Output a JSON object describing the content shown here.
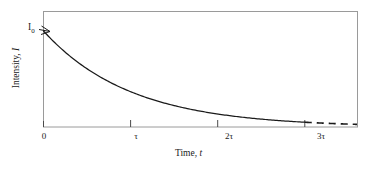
{
  "chart_data": {
    "type": "line",
    "title": "",
    "subtitle": "",
    "xlabel": "Time, t",
    "xlabel_text": "Time,",
    "xlabel_symbol": "t",
    "ylabel": "Intensity, I",
    "ylabel_text": "Intensity,",
    "ylabel_symbol": "I",
    "x_tick_labels": [
      "0",
      "τ",
      "2τ",
      "3τ"
    ],
    "x_tick_values": [
      0,
      1,
      2,
      3
    ],
    "y_tick_labels": [
      "I₀"
    ],
    "y_annotation": "I₀",
    "y_annotation_base": "I",
    "y_annotation_sub": "0",
    "xlim": [
      0,
      3.6
    ],
    "ylim": [
      0,
      1.05
    ],
    "grid": false,
    "legend": null,
    "curve_equation": "I = I0 * exp(-t/tau)",
    "series": [
      {
        "name": "Intensity decay",
        "style": "solid",
        "x": [
          0.0,
          0.15,
          0.3,
          0.45,
          0.6,
          0.75,
          0.9,
          1.0,
          1.2,
          1.4,
          1.6,
          1.8,
          2.0,
          2.2,
          2.4,
          2.6,
          2.8,
          3.0
        ],
        "values": [
          1.0,
          0.861,
          0.741,
          0.638,
          0.549,
          0.472,
          0.407,
          0.368,
          0.301,
          0.247,
          0.202,
          0.165,
          0.135,
          0.111,
          0.091,
          0.074,
          0.061,
          0.05
        ]
      },
      {
        "name": "Intensity decay extrapolation",
        "style": "dashed",
        "x": [
          3.0,
          3.2,
          3.4,
          3.6
        ],
        "values": [
          0.05,
          0.041,
          0.033,
          0.027
        ]
      }
    ],
    "annotations": [
      {
        "name": "initial-intensity-pointer",
        "label": "I₀",
        "x": 0,
        "y": 1.0,
        "arrow": true
      }
    ],
    "colors": {
      "curve": "#1a1a1a",
      "frame": "#9a9a9a",
      "tick": "#4a4a4a",
      "text": "#1a1a1a",
      "background": "#ffffff"
    }
  }
}
